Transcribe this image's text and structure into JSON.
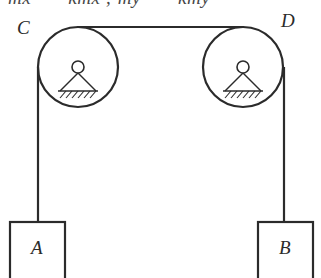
{
  "figure": {
    "caption_equation": "mẍ = −kmẋ ;   mÿ = −kmẏ",
    "background_color": "#ffffff",
    "ink_color": "#2b2b2b",
    "labels": {
      "pulley_left": "C",
      "pulley_right": "D",
      "block_left": "A",
      "block_right": "B"
    },
    "geometry": {
      "pulley_left": {
        "cx": 78,
        "cy": 67,
        "r": 40
      },
      "pulley_right": {
        "cx": 243,
        "cy": 67,
        "r": 40
      },
      "rope_top": {
        "x1": 78,
        "y1": 27,
        "x2": 243,
        "y2": 27
      },
      "cord_left": {
        "x": 38,
        "y1": 67,
        "y2": 222
      },
      "cord_right": {
        "x": 284,
        "y1": 67,
        "y2": 222
      },
      "block_left": {
        "x": 10,
        "y": 222,
        "w": 55,
        "h": 56
      },
      "block_right": {
        "x": 258,
        "y": 222,
        "w": 55,
        "h": 56
      },
      "axle_radius": 6,
      "support_half_width": 18
    }
  }
}
